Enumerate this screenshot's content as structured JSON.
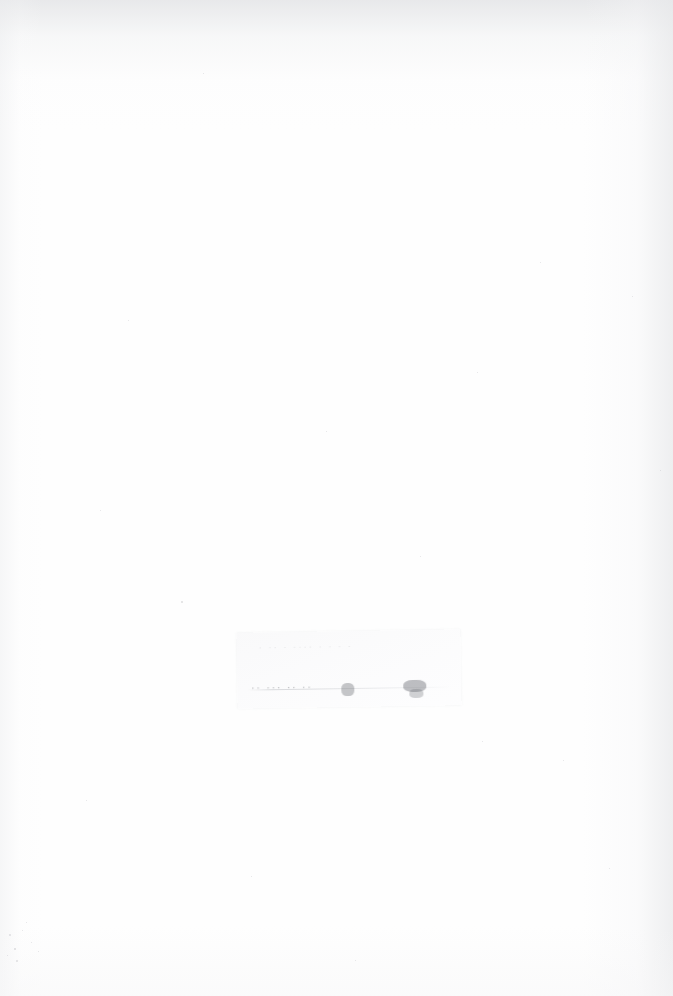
{
  "page": {
    "kind": "scanned-document-page",
    "width": 673,
    "height": 996,
    "orientation": "portrait",
    "condition": "severely faded / washed-out scan; page is effectively blank",
    "background_color": "#fefefe",
    "paper_color": "#ffffff",
    "vignette_color": "#e4e5e7"
  },
  "slip": {
    "present": true,
    "description": "faint off-white rectangular patch, slightly rotated",
    "fill_color": "#f9f9fa",
    "edge_color": "#d2d4d7",
    "text_lines": [
      {
        "id": "upper",
        "legible": false,
        "transcription": "",
        "placeholder_glyphs": "· ··   ·   ···· ·   ·   ·  ·",
        "ink_color": "#969 99e"
      },
      {
        "id": "lower",
        "legible": false,
        "transcription": "",
        "placeholder_glyphs": "··  ···      ··        ··  ",
        "ink_color": "#606369"
      }
    ]
  },
  "artifacts": {
    "dust_specks": [
      {
        "x": 9,
        "y": 934,
        "size": 2.0
      },
      {
        "x": 14,
        "y": 948,
        "size": 1.6
      },
      {
        "x": 22,
        "y": 930,
        "size": 1.3
      },
      {
        "x": 16,
        "y": 960,
        "size": 1.8
      },
      {
        "x": 31,
        "y": 942,
        "size": 1.2
      },
      {
        "x": 7,
        "y": 955,
        "size": 1.4
      },
      {
        "x": 26,
        "y": 922,
        "size": 1.1
      },
      {
        "x": 38,
        "y": 951,
        "size": 1.0
      },
      {
        "x": 181,
        "y": 601,
        "size": 1.5
      },
      {
        "x": 203,
        "y": 73,
        "size": 1.2
      },
      {
        "x": 128,
        "y": 320,
        "size": 1.1
      },
      {
        "x": 326,
        "y": 431,
        "size": 1.3
      },
      {
        "x": 477,
        "y": 372,
        "size": 1.1
      },
      {
        "x": 540,
        "y": 262,
        "size": 1.2
      },
      {
        "x": 632,
        "y": 296,
        "size": 1.0
      },
      {
        "x": 100,
        "y": 510,
        "size": 1.1
      },
      {
        "x": 563,
        "y": 760,
        "size": 1.2
      },
      {
        "x": 482,
        "y": 741,
        "size": 1.0
      },
      {
        "x": 251,
        "y": 876,
        "size": 1.3
      },
      {
        "x": 609,
        "y": 868,
        "size": 1.1
      },
      {
        "x": 355,
        "y": 960,
        "size": 1.0
      },
      {
        "x": 86,
        "y": 800,
        "size": 1.2
      },
      {
        "x": 420,
        "y": 556,
        "size": 1.0
      },
      {
        "x": 660,
        "y": 470,
        "size": 1.1
      }
    ]
  }
}
